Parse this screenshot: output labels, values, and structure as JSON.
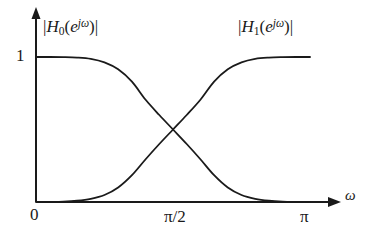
{
  "figure": {
    "background_color": "#ffffff",
    "ink_color": "#1a1a1a",
    "curve_labels": {
      "h0": {
        "bars_open": "|",
        "name": "H",
        "subscript": "0",
        "open_paren": "(",
        "base": "e",
        "exponent": "jω",
        "close_paren": ")",
        "bars_close": "|",
        "full_text": "|H0(e^{jω})|"
      },
      "h1": {
        "bars_open": "|",
        "name": "H",
        "subscript": "1",
        "open_paren": "(",
        "base": "e",
        "exponent": "jω",
        "close_paren": ")",
        "bars_close": "|",
        "full_text": "|H1(e^{jω})|"
      }
    },
    "y_axis": {
      "tick_label": "1",
      "tick_value": 1
    },
    "x_axis": {
      "label": "ω",
      "tick_labels": [
        "0",
        "π/2",
        "π"
      ],
      "tick_values": [
        0,
        1.5708,
        3.1416
      ]
    }
  },
  "chart_data": {
    "type": "line",
    "title": "",
    "xlabel": "ω",
    "ylabel": "",
    "xlim": [
      0,
      3.1416
    ],
    "ylim": [
      0,
      1.08
    ],
    "grid": false,
    "legend": "inline-annotations",
    "x_tick_labels": [
      "0",
      "π/2",
      "π"
    ],
    "x_tick_values": [
      0,
      1.5708,
      3.1416
    ],
    "y_tick_labels": [
      "1"
    ],
    "y_tick_values": [
      1
    ],
    "annotations": [
      {
        "text": "|H0(e^{jω})|",
        "x": 0.45,
        "y": 1.05,
        "series": "H0"
      },
      {
        "text": "|H1(e^{jω})|",
        "x": 2.35,
        "y": 1.05,
        "series": "H1"
      }
    ],
    "crossing_point": {
      "x": 1.5708,
      "y": 0.5
    },
    "x": [
      0,
      0.157,
      0.314,
      0.471,
      0.628,
      0.785,
      0.942,
      1.1,
      1.257,
      1.414,
      1.571,
      1.728,
      1.885,
      2.042,
      2.199,
      2.356,
      2.513,
      2.67,
      2.827,
      2.985,
      3.142
    ],
    "series": [
      {
        "name": "|H0(e^{jω})|",
        "description": "lowpass magnitude response",
        "values": [
          1.0,
          1.0,
          0.999,
          0.996,
          0.987,
          0.963,
          0.915,
          0.83,
          0.705,
          0.6,
          0.5,
          0.4,
          0.295,
          0.185,
          0.1,
          0.048,
          0.022,
          0.009,
          0.003,
          0.001,
          0.0
        ]
      },
      {
        "name": "|H1(e^{jω})|",
        "description": "highpass magnitude response",
        "values": [
          0.0,
          0.001,
          0.003,
          0.009,
          0.022,
          0.048,
          0.1,
          0.185,
          0.295,
          0.4,
          0.5,
          0.6,
          0.705,
          0.83,
          0.915,
          0.963,
          0.987,
          0.996,
          0.999,
          1.0,
          1.0
        ]
      }
    ]
  }
}
